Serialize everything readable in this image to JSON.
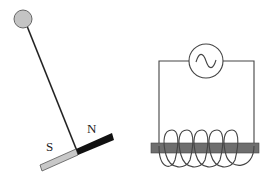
{
  "diagram": {
    "left_apparatus": {
      "description": "Pendulum with bar magnet on a pivot",
      "pivot_color": "#c4c4c4",
      "magnet": {
        "south_label": "S",
        "north_label": "N",
        "south_color": "#c8c8c8",
        "north_color": "#111111"
      }
    },
    "right_apparatus": {
      "description": "Solenoid coil on iron core connected to AC source",
      "source_symbol": "~",
      "coil_turns": 5,
      "core_color": "#6e6e6e"
    }
  }
}
